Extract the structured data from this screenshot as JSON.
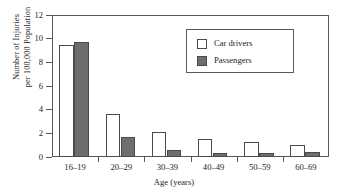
{
  "chart_data": {
    "type": "bar",
    "title": "",
    "xlabel": "Age (years)",
    "ylabel": "Number of Injuries\nper 100,000 Population",
    "categories": [
      "16–19",
      "20–29",
      "30–39",
      "40–49",
      "50–59",
      "60–69"
    ],
    "series": [
      {
        "name": "Car drivers",
        "values": [
          9.5,
          3.6,
          2.1,
          1.55,
          1.3,
          1.05
        ],
        "color": "#ffffff"
      },
      {
        "name": "Passengers",
        "values": [
          9.7,
          1.7,
          0.55,
          0.35,
          0.35,
          0.45
        ],
        "color": "#6e6e6e"
      }
    ],
    "ylim": [
      0,
      12
    ],
    "yticks": [
      0,
      2,
      4,
      6,
      8,
      10,
      12
    ],
    "ytick_labels": [
      "0",
      "2",
      "4",
      "6",
      "8",
      "10",
      "12"
    ],
    "grid": false,
    "legend_position": "upper-right",
    "frame": "box"
  },
  "legend": {
    "entries": [
      {
        "label": "Car drivers",
        "swatch": "hollow-square-swatch"
      },
      {
        "label": "Passengers",
        "swatch": "filled-square-swatch"
      }
    ]
  },
  "axes": {
    "y_title_line1": "Number of Injuries",
    "y_title_line2": "per 100,000 Population",
    "x_title": "Age (years)"
  },
  "colors": {
    "drivers_fill": "#ffffff",
    "passengers_fill": "#6e6e6e",
    "bar_stroke": "#4a4a4a",
    "axis": "#585858",
    "text": "#1d1d1d",
    "background": "#ffffff"
  }
}
